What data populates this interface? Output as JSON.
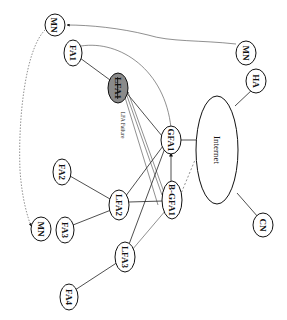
{
  "diagram": {
    "orientation": "rotated 90deg clockwise",
    "nodes": {
      "mn_top": {
        "label": "MN"
      },
      "fa1": {
        "label": "FA1"
      },
      "lfa1": {
        "label": "LFA1",
        "state": "failed"
      },
      "lfa_failure_caption": {
        "label": "LFA Failure"
      },
      "gfa1": {
        "label": "GFA1"
      },
      "internet": {
        "label": "Internet"
      },
      "mn_right": {
        "label": "MN"
      },
      "ha": {
        "label": "HA"
      },
      "cn": {
        "label": "CN"
      },
      "b_gfa1": {
        "label": "B-GFA1"
      },
      "lfa2": {
        "label": "LFA2"
      },
      "fa2": {
        "label": "FA2"
      },
      "fa3": {
        "label": "FA3"
      },
      "mn_bottom": {
        "label": "MN"
      },
      "lfa3": {
        "label": "LFA3"
      },
      "fa4": {
        "label": "FA4"
      }
    },
    "edges": [
      {
        "from": "MN (right)",
        "to": "MN (top)",
        "style": "curved arrow"
      },
      {
        "from": "MN (top)",
        "to": "MN (bottom)",
        "style": "dotted curved arrow"
      },
      {
        "from": "FA1",
        "to": "LFA1",
        "style": "solid"
      },
      {
        "from": "FA1",
        "to": "GFA1",
        "style": "curved solid"
      },
      {
        "from": "GFA1",
        "to": "LFA1",
        "style": "arrow"
      },
      {
        "from": "B-GFA1",
        "to": "LFA1",
        "style": "arrow"
      },
      {
        "from": "GFA1",
        "to": "B-GFA1",
        "style": "bidirectional arrow"
      },
      {
        "from": "GFA1",
        "to": "Internet",
        "style": "solid"
      },
      {
        "from": "B-GFA1",
        "to": "Internet",
        "style": "dashed"
      },
      {
        "from": "HA",
        "to": "Internet",
        "style": "solid"
      },
      {
        "from": "CN",
        "to": "Internet",
        "style": "solid"
      },
      {
        "from": "LFA2",
        "to": "GFA1",
        "style": "solid"
      },
      {
        "from": "LFA2",
        "to": "B-GFA1",
        "style": "solid"
      },
      {
        "from": "LFA3",
        "to": "GFA1",
        "style": "solid"
      },
      {
        "from": "LFA3",
        "to": "B-GFA1",
        "style": "thin"
      },
      {
        "from": "FA2",
        "to": "LFA2",
        "style": "solid"
      },
      {
        "from": "FA3",
        "to": "LFA2",
        "style": "solid"
      },
      {
        "from": "FA4",
        "to": "LFA3",
        "style": "solid"
      }
    ],
    "colors": {
      "failed_node_fill": "#8a8a8a",
      "stroke": "#111111",
      "background": "#ffffff"
    }
  }
}
